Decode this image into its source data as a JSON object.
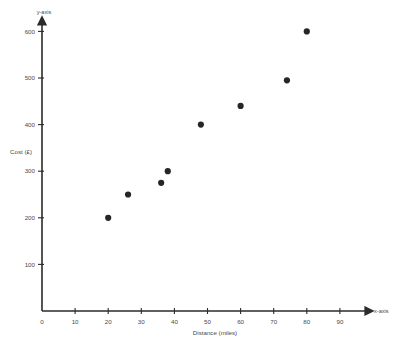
{
  "chart_data": {
    "type": "scatter",
    "title": "",
    "xlabel": "Distance (miles)",
    "ylabel": "Cost (£)",
    "x_axis_name": "x-axis",
    "y_axis_name": "y-axis",
    "xlim": [
      0,
      95
    ],
    "ylim": [
      0,
      640
    ],
    "grid": false,
    "legend": null,
    "marker_color": "#262626",
    "axis_color": "#2b2b2b",
    "x_ticks": [
      0,
      10,
      20,
      30,
      40,
      50,
      60,
      70,
      80,
      90
    ],
    "y_ticks": [
      100,
      200,
      300,
      400,
      500,
      600
    ],
    "x_tick_labels": [
      "0",
      "10",
      "20",
      "30",
      "40",
      "50",
      "60",
      "70",
      "80",
      "90"
    ],
    "y_tick_labels": [
      "100",
      "200",
      "300",
      "400",
      "500",
      "600"
    ],
    "points": [
      {
        "x": 20,
        "y": 200
      },
      {
        "x": 26,
        "y": 250
      },
      {
        "x": 36,
        "y": 275
      },
      {
        "x": 38,
        "y": 300
      },
      {
        "x": 48,
        "y": 400
      },
      {
        "x": 60,
        "y": 440
      },
      {
        "x": 74,
        "y": 495
      },
      {
        "x": 80,
        "y": 600
      }
    ]
  }
}
